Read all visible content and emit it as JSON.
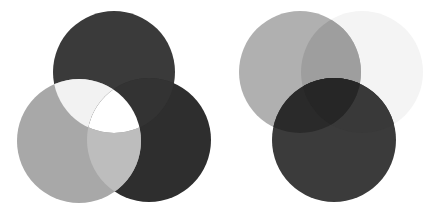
{
  "diagram": {
    "type": "overlapping-circles",
    "groups": [
      {
        "name": "additive-mixing",
        "circles": [
          {
            "id": "top",
            "cx": 114,
            "cy": 72,
            "r": 61,
            "fill": "#3a3a3a"
          },
          {
            "id": "left",
            "cx": 79,
            "cy": 141,
            "r": 62,
            "fill": "#a8a8a8"
          },
          {
            "id": "right",
            "cx": 149,
            "cy": 140,
            "r": 62,
            "fill": "#2e2e2e"
          }
        ],
        "overlap_colors": {
          "top_left": "#f2f2f2",
          "top_right_left_center": "#ffffff",
          "left_right": "#bdbdbd"
        }
      },
      {
        "name": "subtractive-mixing",
        "circles": [
          {
            "id": "gray",
            "cx": 300,
            "cy": 72,
            "r": 61,
            "fill": "#b0b0b0"
          },
          {
            "id": "faint",
            "cx": 362,
            "cy": 72,
            "r": 61,
            "fill": "#f4f4f4"
          },
          {
            "id": "dark",
            "cx": 334,
            "cy": 140,
            "r": 62,
            "fill": "#3b3b3b"
          }
        ],
        "overlap_colors": {
          "gray_faint": "#9e9e9e",
          "gray_dark": "#2a2a2a",
          "dark_faint": "#393939",
          "all": "#262626"
        }
      }
    ]
  }
}
